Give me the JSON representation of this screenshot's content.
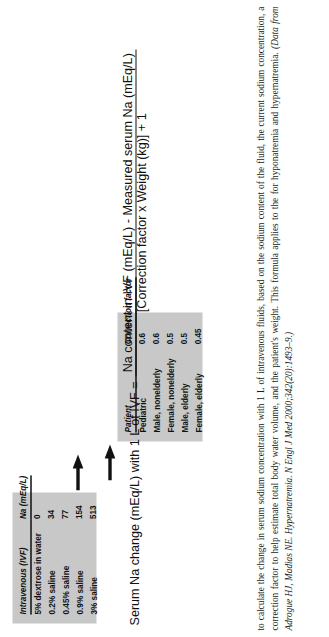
{
  "figure": {
    "ivf_table": {
      "name": "intravenous-fluid-sodium-table",
      "headers": [
        "Intravenous (IVF)",
        "Na (mEq/L)"
      ],
      "rows": [
        {
          "fluid": "5% dextrose in water",
          "na": "0"
        },
        {
          "fluid": "0.2% saline",
          "na": "34"
        },
        {
          "fluid": "0.45% saline",
          "na": "77"
        },
        {
          "fluid": "0.9% saline",
          "na": "154"
        },
        {
          "fluid": "3% saline",
          "na": "513"
        }
      ]
    },
    "correction_table": {
      "name": "correction-factor-table",
      "headers": [
        "Patient",
        "Correction factor"
      ],
      "rows": [
        {
          "patient": "Pediatric",
          "factor": "0.6"
        },
        {
          "patient": "Male, nonelderly",
          "factor": "0.6"
        },
        {
          "patient": "Female, nonelderly",
          "factor": "0.5"
        },
        {
          "patient": "Male, elderly",
          "factor": "0.5"
        },
        {
          "patient": "Female, elderly",
          "factor": "0.45"
        }
      ]
    },
    "formula": {
      "lhs": "Serum Na change (mEq/L) with 1 L of IVF =",
      "numerator": "Na content in IVF (mEq/L) - Measured serum Na (mEq/L)",
      "denominator": "[Correction factor x Weight (kg)] + 1"
    }
  },
  "caption": {
    "paragraph": "to calculate the change in serum sodium concentration with 1 L of intravenous fluids, based on the sodium content of the fluid, the current sodium concentration, a correction factor to help estimate total body water volume, and the patient's weight. This formula applies to the for hyponatremia and hypernatremia.",
    "citation": "(Data from Adrogue HJ, Madias NE. Hypernatremia. N Engl J Med 2000;342(20):1493–9.)"
  },
  "colors": {
    "table_background": "#c8c8c8",
    "text": "#1a1a1a",
    "page_background": "#ffffff"
  }
}
